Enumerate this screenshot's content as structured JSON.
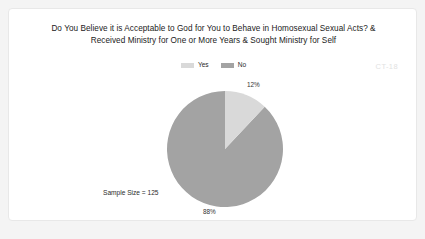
{
  "slide": {
    "title_line_1": "Do You Believe it is Acceptable to God for You to Behave in Homosexual Sexual Acts? &",
    "title_line_2": "Received Ministry for One or More Years & Sought Ministry for Self",
    "watermark": "CT-18",
    "sample_size_label": "Sample Size = 125"
  },
  "legend": {
    "items": [
      {
        "label": "Yes",
        "color": "#d9d9d9"
      },
      {
        "label": "No",
        "color": "#a3a3a3"
      }
    ]
  },
  "chart_data": {
    "type": "pie",
    "title": "Do You Believe it is Acceptable to God for You to Behave in Homosexual Sexual Acts? & Received Ministry for One or More Years & Sought Ministry for Self",
    "categories": [
      "Yes",
      "No"
    ],
    "values": [
      12,
      88
    ],
    "value_labels": [
      "12%",
      "88%"
    ],
    "colors": [
      "#d9d9d9",
      "#a3a3a3"
    ],
    "units": "percent",
    "sample_size": 125,
    "legend_position": "top",
    "start_angle_deg": 0,
    "direction": "clockwise",
    "grid": false
  }
}
